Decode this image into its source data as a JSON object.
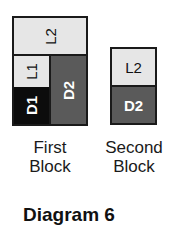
{
  "title": "Diagram 6",
  "colors": {
    "light": "#e6e6e6",
    "dark": "#5a5a5a",
    "black": "#0c0c0c",
    "border": "#1a1a1a"
  },
  "first_block": {
    "caption_line1": "First",
    "caption_line2": "Block",
    "cells": {
      "top": "L2",
      "left_upper": "L1",
      "left_lower": "D1",
      "right": "D2"
    }
  },
  "second_block": {
    "caption_line1": "Second",
    "caption_line2": "Block",
    "cells": {
      "top": "L2",
      "bottom": "D2"
    }
  }
}
